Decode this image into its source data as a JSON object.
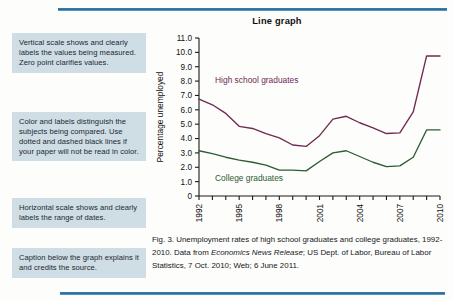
{
  "figure": {
    "title": "Line graph",
    "caption_part1": "Fig. 3. Unemployment rates of high school graduates and college graduates, 1992-2010. Data from ",
    "caption_italic": "Economics News Release",
    "caption_part2": "; US Dept. of Labor, Bureau of Labor Statistics, 7 Oct. 2010; Web; 6 June 2011."
  },
  "annotations": [
    {
      "text": "Vertical scale shows and clearly labels the values being measured. Zero point clarifies values."
    },
    {
      "text": "Color and labels distinguish the subjects being compared. Use dotted and dashed black lines if your paper will not be read in color."
    },
    {
      "text": "Horizontal scale shows and clearly labels the range of dates."
    },
    {
      "text": "Caption below the graph explains it and credits the source."
    }
  ],
  "colors": {
    "rule": "#2d6f9e",
    "annotation_bg": "#cfdde4",
    "high_school_line": "#6e2a52",
    "college_line": "#2c5b34",
    "axis": "#1a1a1a"
  },
  "chart_data": {
    "type": "line",
    "title": "Line graph",
    "xlabel": "",
    "ylabel": "Percentage unemployed",
    "xlim": [
      1992,
      2010
    ],
    "ylim": [
      0,
      11
    ],
    "grid": false,
    "legend": "inline-labels",
    "x": [
      1992,
      1993,
      1994,
      1995,
      1996,
      1997,
      1998,
      1999,
      2000,
      2001,
      2002,
      2003,
      2004,
      2005,
      2006,
      2007,
      2008,
      2009,
      2010
    ],
    "ytick_labels": [
      "0",
      "1.0",
      "2.0",
      "3.0",
      "4.0",
      "5.0",
      "6.0",
      "7.0",
      "8.0",
      "9.0",
      "10.0",
      "11.0"
    ],
    "ytick_values": [
      0,
      1,
      2,
      3,
      4,
      5,
      6,
      7,
      8,
      9,
      10,
      11
    ],
    "xtick_labels": [
      "1992",
      "1995",
      "1998",
      "2001",
      "2004",
      "2007",
      "2010"
    ],
    "xtick_values": [
      1992,
      1995,
      1998,
      2001,
      2004,
      2007,
      2010
    ],
    "series": [
      {
        "name": "High school graduates",
        "color": "#6e2a52",
        "label_x": 1993.2,
        "label_y": 7.85,
        "values": [
          6.75,
          6.35,
          5.75,
          4.85,
          4.7,
          4.35,
          4.05,
          3.55,
          3.45,
          4.2,
          5.35,
          5.55,
          5.1,
          4.75,
          4.35,
          4.4,
          5.85,
          9.75,
          9.75
        ]
      },
      {
        "name": "College graduates",
        "color": "#2c5b34",
        "label_x": 1993.2,
        "label_y": 1.05,
        "values": [
          3.15,
          2.95,
          2.7,
          2.5,
          2.35,
          2.15,
          1.8,
          1.8,
          1.75,
          2.4,
          3.0,
          3.15,
          2.75,
          2.35,
          2.05,
          2.1,
          2.7,
          4.6,
          4.6
        ]
      }
    ]
  }
}
